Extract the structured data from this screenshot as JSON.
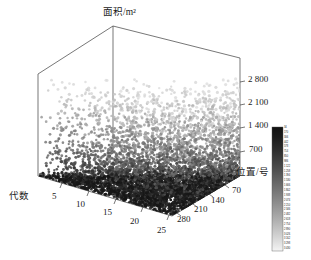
{
  "chart_data": {
    "type": "scatter",
    "title": "",
    "subtitle": "",
    "projection": "3d",
    "xlabel": "代数",
    "ylabel": "位置/号",
    "zlabel": "面积/m²",
    "x_ticks": [
      "5",
      "10",
      "15",
      "20",
      "25"
    ],
    "y_ticks": [
      "70",
      "140",
      "210",
      "280"
    ],
    "z_ticks": [
      "700",
      "1 400",
      "2 100",
      "2 800"
    ],
    "xlim": [
      0,
      27
    ],
    "ylim": [
      0,
      310
    ],
    "zlim": [
      0,
      3200
    ],
    "grid": false,
    "legend": "none",
    "colormap": "grayscale-reversed",
    "color_dark": "#1d1d1d",
    "color_light": "#f2f2f2",
    "marker": "circle",
    "n_points": 9000,
    "colorbar": {
      "orientation": "vertical",
      "label": "",
      "ticks": [
        "34",
        "170",
        "306",
        "442",
        "578",
        "714",
        "850",
        "986",
        "1 122",
        "1 258",
        "1 394",
        "1 530",
        "1 666",
        "1 802",
        "1 938",
        "2 074",
        "2 210",
        "2 346",
        "2 482",
        "2 618",
        "2 754",
        "2 890",
        "3 026",
        "3 162",
        "3 298",
        "3 430"
      ],
      "vmin": 34,
      "vmax": 3430
    },
    "points_note": "Dense dark cluster concentrated at low 面积 values across all 代数 and 位置; density thins out toward high 面积 (above 2 100 m²) where markers are sparse and light gray."
  },
  "figure": {
    "axis_titles": {
      "x": "代数",
      "y": "位置/号",
      "z": "面积/m²"
    }
  }
}
